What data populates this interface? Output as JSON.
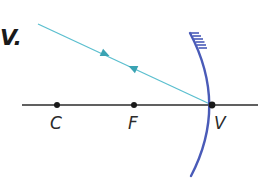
{
  "figure": {
    "part_label": "V.",
    "colors": {
      "ray": "#5bbfcf",
      "mirror": "#4a5bb8",
      "axis": "#2b2b2b",
      "point": "#1a1a1a",
      "text": "#2b2b2b"
    },
    "axis": {
      "x1": 22,
      "x2": 258,
      "y": 105
    },
    "points": [
      {
        "id": "C",
        "label": "C",
        "x": 57,
        "y": 105
      },
      {
        "id": "F",
        "label": "F",
        "x": 134,
        "y": 105
      },
      {
        "id": "V",
        "label": "V",
        "x": 212,
        "y": 105
      }
    ],
    "ray": {
      "start": {
        "x": 38,
        "y": 24
      },
      "end": {
        "x": 212,
        "y": 105
      },
      "arrows": [
        {
          "direction": "toward-mirror",
          "at": 0.38
        },
        {
          "direction": "away-from-mirror",
          "at": 0.55
        }
      ]
    },
    "mirror": {
      "type": "concave",
      "top": {
        "x": 190,
        "y": 33
      },
      "vertex": {
        "x": 212,
        "y": 105
      },
      "bottom": {
        "x": 191,
        "y": 176
      },
      "hatched_side": "back-top"
    }
  }
}
